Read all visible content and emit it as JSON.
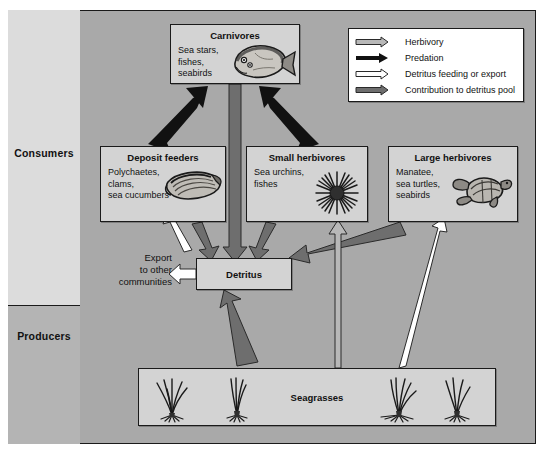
{
  "diagram": {
    "categories": [
      {
        "label": "Consumers"
      },
      {
        "label": "Producers"
      }
    ],
    "colors": {
      "background": "#a9a9a9",
      "box_fill": "#d3d3d3",
      "consumers_panel": "#dcdcdc",
      "producers_panel": "#b4b4b4",
      "herbivory_arrow": "#b0b0b0",
      "predation_arrow": "#111111",
      "detritus_arrow": "#ffffff",
      "contribution_arrow": "#6e6e6e",
      "outline": "#1a1a1a"
    },
    "boxes": {
      "carnivores": {
        "title": "Carnivores",
        "lines": [
          "Sea stars,",
          "fishes,",
          "seabirds"
        ],
        "icon": "flatfish-icon"
      },
      "deposit_feeders": {
        "title": "Deposit feeders",
        "lines": [
          "Polychaetes,",
          "clams,",
          "sea cucumbers"
        ],
        "icon": "clam-icon"
      },
      "small_herbivores": {
        "title": "Small herbivores",
        "lines": [
          "Sea urchins,",
          "fishes"
        ],
        "icon": "sea-urchin-icon"
      },
      "large_herbivores": {
        "title": "Large herbivores",
        "lines": [
          "Manatee,",
          "sea turtles,",
          "seabirds"
        ],
        "icon": "sea-turtle-icon"
      },
      "detritus": {
        "title": "Detritus"
      },
      "seagrasses": {
        "title": "Seagrasses",
        "icon": "seagrass-icon",
        "icon_count": 4
      }
    },
    "export_label": {
      "lines": [
        "Export",
        "to other",
        "communities"
      ]
    },
    "legend": {
      "entries": [
        {
          "label": "Herbivory",
          "arrow": "light-gray-arrow-icon",
          "color": "#b0b0b0"
        },
        {
          "label": "Predation",
          "arrow": "black-arrow-icon",
          "color": "#111111"
        },
        {
          "label": "Detritus feeding or export",
          "arrow": "white-outline-arrow-icon",
          "color": "#ffffff"
        },
        {
          "label": "Contribution to detritus pool",
          "arrow": "dark-gray-arrow-icon",
          "color": "#6e6e6e"
        }
      ]
    },
    "flows": [
      {
        "from": "deposit_feeders",
        "to": "carnivores",
        "type": "Predation"
      },
      {
        "from": "small_herbivores",
        "to": "carnivores",
        "type": "Predation"
      },
      {
        "from": "carnivores",
        "to": "detritus",
        "type": "Contribution to detritus pool"
      },
      {
        "from": "deposit_feeders",
        "to": "detritus",
        "type": "Contribution to detritus pool"
      },
      {
        "from": "detritus",
        "to": "deposit_feeders",
        "type": "Detritus feeding or export"
      },
      {
        "from": "small_herbivores",
        "to": "detritus",
        "type": "Contribution to detritus pool"
      },
      {
        "from": "large_herbivores",
        "to": "detritus",
        "type": "Contribution to detritus pool"
      },
      {
        "from": "seagrasses",
        "to": "detritus",
        "type": "Contribution to detritus pool"
      },
      {
        "from": "seagrasses",
        "to": "small_herbivores",
        "type": "Herbivory"
      },
      {
        "from": "seagrasses",
        "to": "large_herbivores",
        "type": "Detritus feeding or export"
      },
      {
        "from": "detritus",
        "to": "export",
        "type": "Detritus feeding or export"
      }
    ]
  }
}
